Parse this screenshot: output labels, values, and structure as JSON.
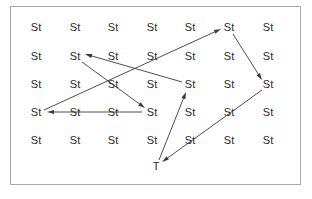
{
  "figure": {
    "border_color": "#a9a9a9",
    "background": "#ffffff",
    "text_color": "#2b2b2b",
    "arrow_color": "#3a3a3a",
    "frame": {
      "x": 10,
      "y": 6,
      "width": 291,
      "height": 179
    }
  },
  "grid": {
    "columns": 7,
    "rows": 5,
    "column_x": [
      36,
      75,
      113,
      152,
      190,
      229,
      268
    ],
    "row_y": [
      27,
      56,
      84,
      112,
      140
    ],
    "state_label": "St",
    "terminal_label": "T"
  },
  "nodes": [
    {
      "id": "r1c1",
      "label": "St",
      "x": 36,
      "y": 27
    },
    {
      "id": "r1c2",
      "label": "St",
      "x": 75,
      "y": 27
    },
    {
      "id": "r1c3",
      "label": "St",
      "x": 113,
      "y": 27
    },
    {
      "id": "r1c4",
      "label": "St",
      "x": 152,
      "y": 27
    },
    {
      "id": "r1c5",
      "label": "St",
      "x": 190,
      "y": 27
    },
    {
      "id": "r1c6",
      "label": "St",
      "x": 229,
      "y": 27
    },
    {
      "id": "r1c7",
      "label": "St",
      "x": 268,
      "y": 27
    },
    {
      "id": "r2c1",
      "label": "St",
      "x": 36,
      "y": 56
    },
    {
      "id": "r2c2",
      "label": "St",
      "x": 75,
      "y": 56
    },
    {
      "id": "r2c3",
      "label": "St",
      "x": 113,
      "y": 56
    },
    {
      "id": "r2c4",
      "label": "St",
      "x": 152,
      "y": 56
    },
    {
      "id": "r2c5",
      "label": "St",
      "x": 190,
      "y": 56
    },
    {
      "id": "r2c6",
      "label": "St",
      "x": 229,
      "y": 56
    },
    {
      "id": "r2c7",
      "label": "St",
      "x": 268,
      "y": 56
    },
    {
      "id": "r3c1",
      "label": "St",
      "x": 36,
      "y": 84
    },
    {
      "id": "r3c2",
      "label": "St",
      "x": 75,
      "y": 84
    },
    {
      "id": "r3c3",
      "label": "St",
      "x": 113,
      "y": 84
    },
    {
      "id": "r3c4",
      "label": "St",
      "x": 152,
      "y": 84
    },
    {
      "id": "r3c5",
      "label": "St",
      "x": 190,
      "y": 84
    },
    {
      "id": "r3c6",
      "label": "St",
      "x": 229,
      "y": 84
    },
    {
      "id": "r3c7",
      "label": "St",
      "x": 268,
      "y": 84
    },
    {
      "id": "r4c1",
      "label": "St",
      "x": 36,
      "y": 112
    },
    {
      "id": "r4c2",
      "label": "St",
      "x": 75,
      "y": 112
    },
    {
      "id": "r4c3",
      "label": "St",
      "x": 113,
      "y": 112
    },
    {
      "id": "r4c4",
      "label": "St",
      "x": 152,
      "y": 112
    },
    {
      "id": "r4c5",
      "label": "St",
      "x": 190,
      "y": 112
    },
    {
      "id": "r4c6",
      "label": "St",
      "x": 229,
      "y": 112
    },
    {
      "id": "r4c7",
      "label": "St",
      "x": 268,
      "y": 112
    },
    {
      "id": "r5c1",
      "label": "St",
      "x": 36,
      "y": 140
    },
    {
      "id": "r5c2",
      "label": "St",
      "x": 75,
      "y": 140
    },
    {
      "id": "r5c3",
      "label": "St",
      "x": 113,
      "y": 140
    },
    {
      "id": "r5c4",
      "label": "St",
      "x": 152,
      "y": 140
    },
    {
      "id": "r5c5",
      "label": "St",
      "x": 190,
      "y": 140
    },
    {
      "id": "r5c6",
      "label": "St",
      "x": 229,
      "y": 140
    },
    {
      "id": "r5c7",
      "label": "St",
      "x": 268,
      "y": 140
    },
    {
      "id": "term",
      "label": "T",
      "x": 156,
      "y": 166
    }
  ],
  "arrows": [
    {
      "id": "a1",
      "from": "r4c1",
      "to": "r1c6",
      "x1": 44,
      "y1": 110,
      "x2": 221,
      "y2": 29,
      "head": "end"
    },
    {
      "id": "a2",
      "from": "r1c6",
      "to": "r3c7",
      "x1": 233,
      "y1": 34,
      "x2": 262,
      "y2": 80,
      "head": "end"
    },
    {
      "id": "a3",
      "from": "r3c7",
      "to": "term",
      "x1": 262,
      "y1": 90,
      "x2": 162,
      "y2": 162,
      "head": "end"
    },
    {
      "id": "a4",
      "from": "term",
      "to": "r3c5",
      "x1": 159,
      "y1": 160,
      "x2": 186,
      "y2": 92,
      "head": "end"
    },
    {
      "id": "a5",
      "from": "r3c5",
      "to": "r2c2",
      "x1": 182,
      "y1": 82,
      "x2": 85,
      "y2": 54,
      "head": "end"
    },
    {
      "id": "a6",
      "from": "r2c2",
      "to": "r4c4",
      "x1": 82,
      "y1": 62,
      "x2": 145,
      "y2": 108,
      "head": "end"
    },
    {
      "id": "a7",
      "from": "r4c4",
      "to": "r4c1",
      "x1": 142,
      "y1": 112,
      "x2": 47,
      "y2": 112,
      "head": "end"
    }
  ],
  "arrow_style": {
    "stroke_width": 0.9,
    "head_length": 7,
    "head_width": 4.2
  }
}
